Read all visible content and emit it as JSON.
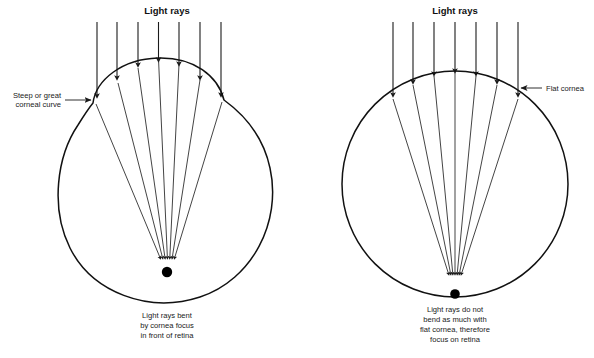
{
  "figure": {
    "name": "corneal-curvature-refraction-comparison",
    "background_color": "#ffffff",
    "ink_color": "#111111",
    "width": 594,
    "height": 358
  },
  "panels": [
    {
      "id": "steep-cornea-panel",
      "title": "Light rays",
      "annotation": {
        "line1": "Steep or great",
        "line2": "corneal curve"
      },
      "caption": {
        "line1": "Light rays bent",
        "line2": "by cornea focus",
        "line3": "in front of retina"
      },
      "eye": {
        "center_x": 167,
        "center_y": 196,
        "radius": 110,
        "cornea_type": "steep",
        "focus_x": 167,
        "focus_y": 262,
        "retina_dot_x": 167,
        "retina_dot_y": 272,
        "retina_dot_r": 5.2
      },
      "incident_rays": {
        "count": 7,
        "x_positions": [
          97,
          117,
          138,
          158,
          179,
          200,
          221
        ],
        "top_y": 22
      }
    },
    {
      "id": "flat-cornea-panel",
      "title": "Light rays",
      "annotation": {
        "line1": "Flat cornea",
        "line2": ""
      },
      "caption": {
        "line1": "Light rays do not",
        "line2": "bend as much with",
        "line3": "flat cornea, therefore",
        "line4": "focus on retina"
      },
      "eye": {
        "center_x": 455,
        "center_y": 184,
        "radius": 113,
        "cornea_type": "flat",
        "focus_x": 455,
        "focus_y": 278,
        "retina_dot_x": 455,
        "retina_dot_y": 295,
        "retina_dot_r": 4.8
      },
      "incident_rays": {
        "count": 7,
        "x_positions": [
          393,
          413,
          434,
          455,
          476,
          497,
          518
        ],
        "top_y": 22
      }
    }
  ],
  "icons": {
    "down_arrow": "downward-arrow-icon",
    "leader_arrow": "leader-arrow-icon"
  }
}
